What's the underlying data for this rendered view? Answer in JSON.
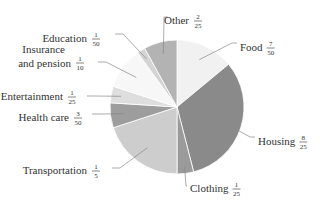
{
  "chart_data": {
    "type": "pie",
    "title": "",
    "start": "top",
    "direction": "clockwise",
    "slices": [
      {
        "name": "Food",
        "numerator": 7,
        "denominator": 50,
        "value": 0.14,
        "color": "#f1f1f1"
      },
      {
        "name": "Housing",
        "numerator": 8,
        "denominator": 25,
        "value": 0.32,
        "color": "#8a8a8a"
      },
      {
        "name": "Clothing",
        "numerator": 1,
        "denominator": 25,
        "value": 0.04,
        "color": "#9a9a9a"
      },
      {
        "name": "Transportation",
        "numerator": 1,
        "denominator": 5,
        "value": 0.2,
        "color": "#cdcdcd"
      },
      {
        "name": "Health care",
        "numerator": 3,
        "denominator": 50,
        "value": 0.06,
        "color": "#9d9d9d"
      },
      {
        "name": "Entertainment",
        "numerator": 1,
        "denominator": 25,
        "value": 0.04,
        "color": "#dedede"
      },
      {
        "name": "Insurance and pension",
        "numerator": 1,
        "denominator": 10,
        "value": 0.1,
        "color": "#f7f7f7"
      },
      {
        "name": "Education",
        "numerator": 1,
        "denominator": 50,
        "value": 0.02,
        "color": "#d4d4d4"
      },
      {
        "name": "Other",
        "numerator": 2,
        "denominator": 25,
        "value": 0.08,
        "color": "#b3b3b3"
      }
    ]
  }
}
